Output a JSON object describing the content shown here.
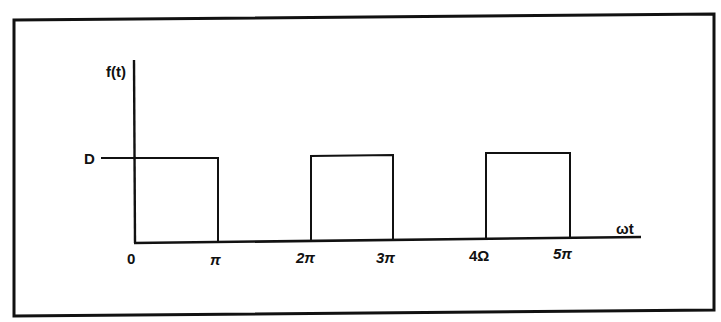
{
  "diagram": {
    "type": "square-wave-plot",
    "y_axis_label": "f(t)",
    "x_axis_label": "ωt",
    "level_label": "D",
    "tick_labels": [
      {
        "text": "0",
        "x": 130
      },
      {
        "text": "π",
        "x": 214
      },
      {
        "text": "2π",
        "x": 303
      },
      {
        "text": "3π",
        "x": 378
      },
      {
        "text": "4Ω",
        "x": 476
      },
      {
        "text": "5π",
        "x": 557
      }
    ],
    "pulses": [
      {
        "start": "0",
        "end": "π",
        "height": "D"
      },
      {
        "start": "2π",
        "end": "3π",
        "height": "D"
      },
      {
        "start": "4Ω",
        "end": "5π",
        "height": "D"
      }
    ],
    "colors": {
      "line": "#111111",
      "background": "#ffffff"
    }
  }
}
